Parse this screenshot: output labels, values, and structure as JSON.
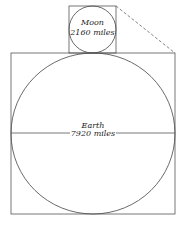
{
  "diagram": {
    "type": "size comparison",
    "moon": {
      "name": "Moon",
      "diameter_label": "2160 miles",
      "box": {
        "x": 69,
        "y": 6,
        "w": 47,
        "h": 47
      },
      "circle": {
        "cx": 92.5,
        "cy": 29.5,
        "r": 23.5
      }
    },
    "earth": {
      "name": "Earth",
      "diameter_label": "7920 miles",
      "box": {
        "x": 11,
        "y": 53,
        "w": 164,
        "h": 161
      },
      "circle": {
        "cx": 93,
        "cy": 133,
        "rx": 82,
        "ry": 80.5
      }
    },
    "connector": {
      "style": "dashed",
      "from": [
        116,
        6
      ],
      "to": [
        175,
        53
      ]
    },
    "colors": {
      "stroke": "#555555",
      "text": "#222222",
      "background": "#ffffff"
    }
  }
}
